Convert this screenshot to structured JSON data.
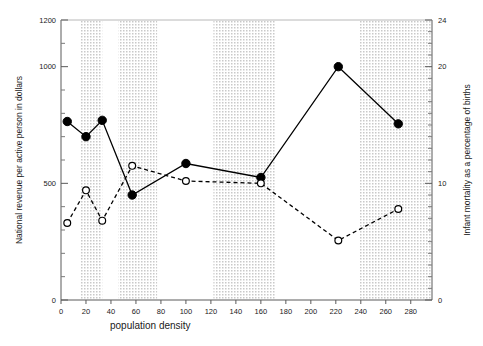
{
  "chart_data": {
    "type": "line",
    "title": "",
    "xlabel": "population density",
    "ylabel": "National revenue per active person in dollars",
    "y2label": "Infant mortality as a percentage of births",
    "xlim": [
      0,
      297
    ],
    "ylim": [
      0,
      1200
    ],
    "y2lim": [
      0,
      24
    ],
    "xticks": [
      0,
      20,
      40,
      60,
      80,
      100,
      120,
      140,
      160,
      180,
      200,
      220,
      240,
      260,
      280
    ],
    "xtick_labels": [
      "0",
      "20",
      "40",
      "60",
      "80",
      "100",
      "120",
      "140",
      "160",
      "180",
      "200",
      "220",
      "240",
      "260",
      "280"
    ],
    "yticks": [
      0,
      500,
      1000,
      1200
    ],
    "ytick_labels": [
      "0",
      "500",
      "1000",
      "1200"
    ],
    "yminorticks": [
      100,
      200,
      300,
      400,
      600,
      700,
      800,
      900,
      1100
    ],
    "y2ticks": [
      0,
      10,
      20,
      24
    ],
    "y2tick_labels": [
      "0",
      "10",
      "20",
      "24"
    ],
    "y2minorticks": [
      1,
      2,
      3,
      4,
      5,
      6,
      7,
      8,
      9,
      11,
      12,
      13,
      14,
      15,
      16,
      17,
      18,
      19,
      21,
      22,
      23
    ],
    "grid": false,
    "legend_position": "none",
    "x": [
      5,
      20,
      33,
      57,
      100,
      160,
      222,
      270
    ],
    "series": [
      {
        "name": "National revenue per active person in dollars",
        "axis": "left",
        "marker": "filled-circle",
        "line_style": "solid",
        "color": "#000000",
        "values": [
          765,
          700,
          770,
          450,
          585,
          525,
          1000,
          755
        ]
      },
      {
        "name": "Infant mortality as a percentage of births",
        "axis": "right",
        "marker": "open-circle",
        "line_style": "dashed",
        "color": "#000000",
        "values": [
          6.6,
          9.4,
          6.8,
          11.5,
          10.2,
          10.0,
          5.1,
          7.8
        ]
      }
    ],
    "shaded_bands": [
      {
        "x0": 16,
        "x1": 33
      },
      {
        "x0": 46,
        "x1": 77
      },
      {
        "x0": 122,
        "x1": 172
      },
      {
        "x0": 239,
        "x1": 297
      }
    ],
    "band_fill": "#d8d8d8"
  }
}
